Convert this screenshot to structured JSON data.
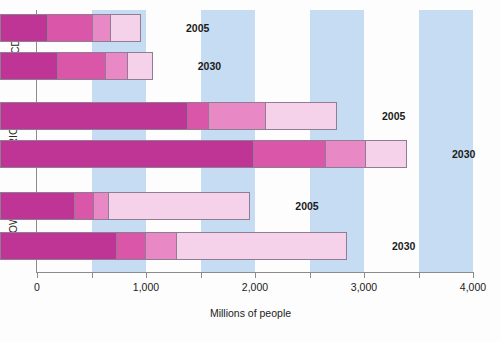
{
  "chart_data": {
    "type": "bar",
    "orientation": "horizontal",
    "stacked": true,
    "title": "",
    "xlabel": "Millions of people",
    "ylabel": "",
    "xlim": [
      0,
      4000
    ],
    "xticks": [
      0,
      500,
      1000,
      1500,
      2000,
      2500,
      3000,
      3500,
      4000
    ],
    "xticklabels": [
      "0",
      "",
      "1,000",
      "",
      "2,000",
      "",
      "3,000",
      "",
      "4,000"
    ],
    "xtick_labeled": [
      "0",
      "1,000",
      "2,000",
      "3,000",
      "4,000"
    ],
    "grid": false,
    "bands": "alternating light-blue vertical bands every 500 units",
    "legend": "none",
    "groups": [
      "OECD",
      "BRIC",
      "ROW"
    ],
    "categories": [
      "OECD 2005",
      "OECD 2030",
      "BRIC 2005",
      "BRIC 2030",
      "ROW 2005",
      "ROW 2030"
    ],
    "series": [
      {
        "name": "segment-1",
        "color": "#be3596",
        "values": [
          427,
          520,
          1712,
          2324,
          682,
          1064
        ]
      },
      {
        "name": "segment-2",
        "color": "#d956a8",
        "values": [
          413,
          443,
          199,
          658,
          174,
          266
        ]
      },
      {
        "name": "segment-3",
        "color": "#e888c4",
        "values": [
          169,
          205,
          520,
          367,
          138,
          284
        ]
      },
      {
        "name": "segment-4",
        "color": "#f5d2ea",
        "values": [
          266,
          215,
          642,
          367,
          1284,
          1550
        ]
      }
    ],
    "totals": [
      1275,
      1383,
      3073,
      3716,
      2278,
      3165
    ],
    "bars": [
      {
        "group": "OECD",
        "label": "2005",
        "segments": [
          427,
          413,
          169,
          266
        ],
        "total": 1275
      },
      {
        "group": "OECD",
        "label": "2030",
        "segments": [
          520,
          443,
          205,
          215
        ],
        "total": 1383
      },
      {
        "group": "BRIC",
        "label": "2005",
        "segments": [
          1712,
          199,
          520,
          642
        ],
        "total": 3073
      },
      {
        "group": "BRIC",
        "label": "2030",
        "segments": [
          2324,
          658,
          367,
          367
        ],
        "total": 3716
      },
      {
        "group": "ROW",
        "label": "2005",
        "segments": [
          682,
          174,
          138,
          1284
        ],
        "total": 2278
      },
      {
        "group": "ROW",
        "label": "2030",
        "segments": [
          1064,
          266,
          284,
          1550
        ],
        "total": 3165
      }
    ]
  },
  "axis": {
    "x_title": "Millions of people",
    "tick_0": "0",
    "tick_1000": "1,000",
    "tick_2000": "2,000",
    "tick_3000": "3,000",
    "tick_4000": "4,000"
  },
  "groups": {
    "oecd": {
      "name": "OECD",
      "bar_2005": {
        "label": "2005"
      },
      "bar_2030": {
        "label": "2030"
      }
    },
    "bric": {
      "name": "BRIC",
      "bar_2005": {
        "label": "2005"
      },
      "bar_2030": {
        "label": "2030"
      }
    },
    "row": {
      "name": "ROW",
      "bar_2005": {
        "label": "2005"
      },
      "bar_2030": {
        "label": "2030"
      }
    }
  },
  "colors": {
    "segment_1": "#be3596",
    "segment_2": "#d956a8",
    "segment_3": "#e888c4",
    "segment_4": "#f5d2ea",
    "band": "#c5dcf2",
    "axis": "#8c8c8c",
    "bar_border": "#8f7d94"
  }
}
